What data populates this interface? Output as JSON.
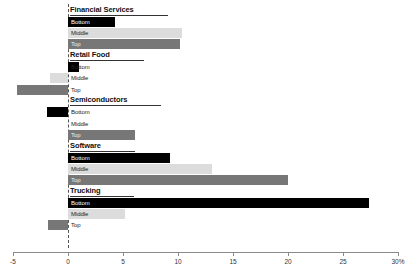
{
  "chart_data": {
    "type": "bar",
    "orientation": "horizontal",
    "title": "",
    "xlabel": "",
    "ylabel": "",
    "xlim": [
      -5,
      30
    ],
    "xticks": [
      -5,
      0,
      5,
      10,
      15,
      20,
      25,
      30
    ],
    "xtick_labels": [
      "-5",
      "0",
      "5",
      "10",
      "15",
      "20",
      "25",
      "30%"
    ],
    "grid": false,
    "legend_position": "none",
    "zero_line": 0,
    "series_names": [
      "Bottom",
      "Middle",
      "Top"
    ],
    "series_colors": [
      "#000000",
      "#dcdcdc",
      "#777777"
    ],
    "categories": [
      "Financial Services",
      "Retail Food",
      "Semiconductors",
      "Software",
      "Trucking"
    ],
    "groups": [
      {
        "label": "Financial Services",
        "bars": [
          {
            "name": "Bottom",
            "value": 4.3
          },
          {
            "name": "Middle",
            "value": 10.4
          },
          {
            "name": "Top",
            "value": 10.2
          }
        ]
      },
      {
        "label": "Retail Food",
        "bars": [
          {
            "name": "Bottom",
            "value": 1.0
          },
          {
            "name": "Middle",
            "value": -1.6
          },
          {
            "name": "Top",
            "value": -4.6
          }
        ]
      },
      {
        "label": "Semiconductors",
        "bars": [
          {
            "name": "Bottom",
            "value": -1.9
          },
          {
            "name": "Middle",
            "value": 0.0
          },
          {
            "name": "Top",
            "value": 6.1
          }
        ]
      },
      {
        "label": "Software",
        "bars": [
          {
            "name": "Bottom",
            "value": 9.3
          },
          {
            "name": "Middle",
            "value": 13.1
          },
          {
            "name": "Top",
            "value": 20.0
          }
        ]
      },
      {
        "label": "Trucking",
        "bars": [
          {
            "name": "Bottom",
            "value": 27.4
          },
          {
            "name": "Middle",
            "value": 5.2
          },
          {
            "name": "Top",
            "value": -1.8
          }
        ]
      }
    ]
  }
}
